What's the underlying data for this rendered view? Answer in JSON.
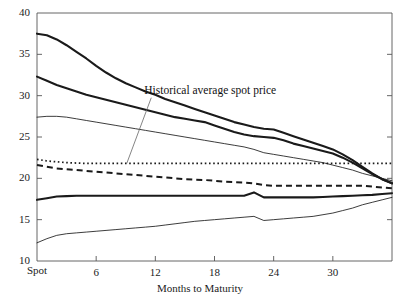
{
  "chart_data": {
    "type": "line",
    "title": "",
    "xlabel": "Months to Maturity",
    "ylabel": "",
    "xlim": [
      0,
      36
    ],
    "ylim": [
      10,
      40
    ],
    "grid": false,
    "legend": null,
    "x_tick_labels": [
      "Spot",
      "6",
      "12",
      "18",
      "24",
      "30"
    ],
    "x_tick_values": [
      0,
      6,
      12,
      18,
      24,
      30
    ],
    "y_tick_labels": [
      "10",
      "15",
      "20",
      "25",
      "30",
      "35",
      "40"
    ],
    "y_tick_values": [
      10,
      15,
      20,
      25,
      30,
      35,
      40
    ],
    "annotations": [
      {
        "text": "Historical average spot price",
        "x": 12.4,
        "y": 30.6,
        "pointer_x": 9.1,
        "pointer_y": 21.8
      }
    ],
    "x": [
      0,
      1,
      2,
      3,
      4,
      5,
      6,
      7,
      8,
      9,
      10,
      11,
      12,
      13,
      14,
      15,
      16,
      17,
      18,
      19,
      20,
      21,
      22,
      23,
      24,
      25,
      26,
      27,
      28,
      29,
      30,
      31,
      32,
      33,
      34,
      35,
      36
    ],
    "series": [
      {
        "name": "upper-curve-heavy",
        "style": "solid",
        "weight": "heavy",
        "values": [
          37.5,
          37.3,
          36.8,
          36.1,
          35.3,
          34.5,
          33.6,
          32.8,
          32.1,
          31.5,
          31.0,
          30.5,
          30.1,
          29.6,
          29.2,
          28.8,
          28.4,
          28.0,
          27.6,
          27.2,
          26.8,
          26.5,
          26.2,
          26.0,
          25.9,
          25.5,
          25.1,
          24.7,
          24.3,
          23.9,
          23.5,
          22.9,
          22.2,
          21.4,
          20.6,
          19.9,
          19.4
        ]
      },
      {
        "name": "second-curve-heavy",
        "style": "solid",
        "weight": "heavy",
        "values": [
          32.3,
          31.8,
          31.3,
          30.9,
          30.5,
          30.1,
          29.8,
          29.5,
          29.2,
          28.9,
          28.6,
          28.3,
          28.0,
          27.7,
          27.4,
          27.2,
          27.0,
          26.8,
          26.4,
          26.0,
          25.6,
          25.3,
          25.1,
          25.0,
          24.9,
          24.6,
          24.2,
          23.9,
          23.6,
          23.3,
          23.0,
          22.5,
          21.9,
          21.2,
          20.5,
          19.9,
          19.4
        ]
      },
      {
        "name": "third-curve-light",
        "style": "solid",
        "weight": "light",
        "values": [
          27.4,
          27.5,
          27.5,
          27.4,
          27.2,
          27.0,
          26.8,
          26.6,
          26.4,
          26.2,
          26.0,
          25.8,
          25.6,
          25.4,
          25.2,
          25.0,
          24.8,
          24.6,
          24.4,
          24.2,
          24.0,
          23.8,
          23.5,
          23.1,
          22.9,
          22.7,
          22.5,
          22.3,
          22.1,
          21.9,
          21.6,
          21.3,
          21.0,
          20.6,
          20.3,
          20.0,
          19.7
        ]
      },
      {
        "name": "historical-average-spot-price",
        "style": "dotted",
        "weight": "light",
        "values": [
          22.3,
          22.1,
          22.0,
          21.9,
          21.85,
          21.8,
          21.8,
          21.8,
          21.8,
          21.8,
          21.8,
          21.8,
          21.8,
          21.8,
          21.8,
          21.8,
          21.8,
          21.8,
          21.8,
          21.8,
          21.8,
          21.8,
          21.8,
          21.8,
          21.8,
          21.8,
          21.8,
          21.8,
          21.8,
          21.8,
          21.8,
          21.8,
          21.8,
          21.8,
          21.8,
          21.8,
          21.8
        ]
      },
      {
        "name": "dashed-curve",
        "style": "dashed",
        "weight": "heavy",
        "values": [
          21.6,
          21.4,
          21.2,
          21.1,
          21.0,
          20.9,
          20.8,
          20.7,
          20.6,
          20.5,
          20.4,
          20.3,
          20.2,
          20.1,
          20.0,
          19.9,
          19.85,
          19.8,
          19.7,
          19.6,
          19.55,
          19.5,
          19.4,
          19.2,
          19.1,
          19.1,
          19.1,
          19.1,
          19.1,
          19.1,
          19.1,
          19.1,
          19.1,
          19.1,
          19.0,
          18.9,
          18.8
        ]
      },
      {
        "name": "lower-curve-heavy",
        "style": "solid",
        "weight": "heavy",
        "values": [
          17.4,
          17.6,
          17.8,
          17.85,
          17.9,
          17.9,
          17.9,
          17.9,
          17.9,
          17.9,
          17.9,
          17.9,
          17.9,
          17.9,
          17.9,
          17.9,
          17.9,
          17.9,
          17.9,
          17.9,
          17.9,
          17.9,
          18.3,
          17.7,
          17.7,
          17.7,
          17.7,
          17.7,
          17.7,
          17.75,
          17.8,
          17.85,
          17.9,
          17.95,
          18.0,
          18.1,
          18.2
        ]
      },
      {
        "name": "bottom-curve-light",
        "style": "solid",
        "weight": "light",
        "values": [
          12.2,
          12.7,
          13.1,
          13.3,
          13.4,
          13.5,
          13.6,
          13.7,
          13.8,
          13.9,
          14.0,
          14.1,
          14.2,
          14.35,
          14.5,
          14.65,
          14.8,
          14.9,
          15.0,
          15.1,
          15.2,
          15.3,
          15.4,
          14.9,
          15.0,
          15.1,
          15.2,
          15.3,
          15.4,
          15.6,
          15.8,
          16.1,
          16.4,
          16.8,
          17.1,
          17.4,
          17.7
        ]
      }
    ]
  }
}
